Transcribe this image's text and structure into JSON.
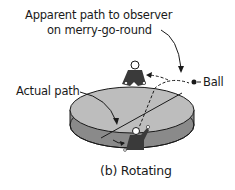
{
  "diagram": {
    "labels": {
      "apparent_line1": "Apparent path to observer",
      "apparent_line2": "on merry-go-round",
      "actual_path": "Actual path",
      "ball": "Ball",
      "caption": "(b) Rotating"
    },
    "colors": {
      "platform_top": "#b8b8b8",
      "platform_side": "#8a8a8a",
      "figure": "#3a3a3a",
      "ink": "#1a1a1a"
    }
  }
}
